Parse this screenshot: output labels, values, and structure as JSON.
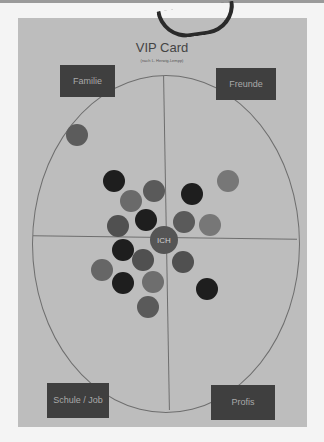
{
  "card": {
    "title": "VIP Card",
    "subtitle": "(nach L. Herwig-Lempp)"
  },
  "quadrants": [
    {
      "id": "familie",
      "label": "Familie",
      "x": 60,
      "y": 65,
      "w": 55,
      "h": 32
    },
    {
      "id": "freunde",
      "label": "Freunde",
      "x": 216,
      "y": 68,
      "w": 60,
      "h": 32
    },
    {
      "id": "schule-job",
      "label": "Schule / Job",
      "x": 47,
      "y": 383,
      "w": 62,
      "h": 35
    },
    {
      "id": "profis",
      "label": "Profis",
      "x": 211,
      "y": 385,
      "w": 64,
      "h": 35
    }
  ],
  "center": {
    "label": "ICH",
    "x": 164,
    "y": 240,
    "r": 14,
    "color": "#555555"
  },
  "tokens": [
    {
      "x": 77,
      "y": 135,
      "r": 11,
      "color": "#5c5c5c"
    },
    {
      "x": 114,
      "y": 181,
      "r": 11,
      "color": "#1e1e1e"
    },
    {
      "x": 154,
      "y": 191,
      "r": 11,
      "color": "#5a5a5a"
    },
    {
      "x": 131,
      "y": 201,
      "r": 11,
      "color": "#6a6a6a"
    },
    {
      "x": 192,
      "y": 194,
      "r": 11,
      "color": "#1e1e1e"
    },
    {
      "x": 228,
      "y": 181,
      "r": 11,
      "color": "#777777"
    },
    {
      "x": 146,
      "y": 220,
      "r": 11,
      "color": "#1e1e1e"
    },
    {
      "x": 118,
      "y": 226,
      "r": 11,
      "color": "#505050"
    },
    {
      "x": 184,
      "y": 222,
      "r": 11,
      "color": "#5a5a5a"
    },
    {
      "x": 210,
      "y": 225,
      "r": 11,
      "color": "#777777"
    },
    {
      "x": 123,
      "y": 250,
      "r": 11,
      "color": "#1e1e1e"
    },
    {
      "x": 143,
      "y": 260,
      "r": 11,
      "color": "#505050"
    },
    {
      "x": 102,
      "y": 270,
      "r": 11,
      "color": "#666666"
    },
    {
      "x": 183,
      "y": 262,
      "r": 11,
      "color": "#505050"
    },
    {
      "x": 123,
      "y": 283,
      "r": 11,
      "color": "#1e1e1e"
    },
    {
      "x": 153,
      "y": 282,
      "r": 11,
      "color": "#6e6e6e"
    },
    {
      "x": 207,
      "y": 289,
      "r": 11,
      "color": "#1e1e1e"
    },
    {
      "x": 148,
      "y": 307,
      "r": 11,
      "color": "#5a5a5a"
    }
  ]
}
